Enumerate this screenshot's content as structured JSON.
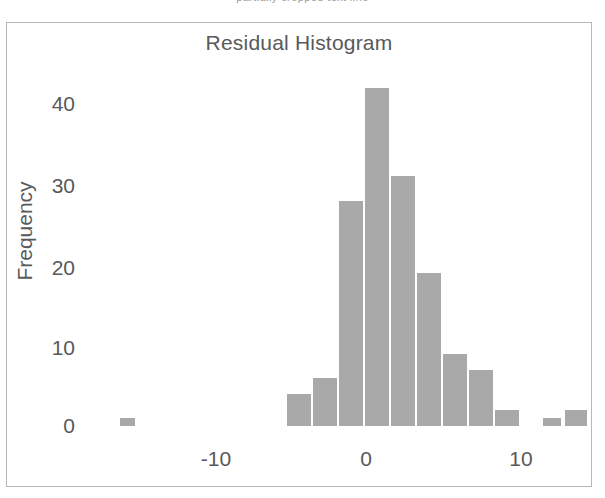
{
  "top_clip_text": "partially cropped text line",
  "figure": {
    "title": "Residual Histogram",
    "frame_color": "#b7b7b7",
    "background": "#ffffff"
  },
  "axes": {
    "y_label": "Frequency",
    "y_ticks": [
      "0",
      "10",
      "20",
      "30",
      "40"
    ],
    "x_ticks": [
      "-10",
      "0",
      "10"
    ]
  },
  "chart_data": {
    "type": "bar",
    "title": "Residual Histogram",
    "xlabel": "",
    "ylabel": "Frequency",
    "xlim": [
      -17,
      14
    ],
    "ylim": [
      0,
      45
    ],
    "grid": false,
    "legend": false,
    "bar_color": "#a9a9a9",
    "bin_width": 1.5,
    "x_tick_values": [
      -10,
      0,
      10
    ],
    "y_tick_values": [
      0,
      10,
      20,
      30,
      40
    ],
    "bin_centers": [
      -15.6,
      -5.2,
      -3.7,
      -2.2,
      -0.7,
      0.8,
      2.3,
      3.8,
      5.3,
      6.8,
      10.6,
      12.1
    ],
    "values": [
      1,
      4,
      6,
      28,
      42,
      31,
      19,
      9,
      7,
      2,
      1,
      2
    ],
    "bars": [
      {
        "center": -15.6,
        "value": 1,
        "px_left": 113,
        "px_width": 15
      },
      {
        "center": -5.2,
        "value": 4,
        "px_left": 280,
        "px_width": 24
      },
      {
        "center": -3.7,
        "value": 6,
        "px_left": 306,
        "px_width": 24
      },
      {
        "center": -2.2,
        "value": 28,
        "px_left": 332,
        "px_width": 24
      },
      {
        "center": -0.7,
        "value": 42,
        "px_left": 358,
        "px_width": 24
      },
      {
        "center": 0.8,
        "value": 31,
        "px_left": 384,
        "px_width": 24
      },
      {
        "center": 2.3,
        "value": 19,
        "px_left": 410,
        "px_width": 24
      },
      {
        "center": 3.8,
        "value": 9,
        "px_left": 436,
        "px_width": 24
      },
      {
        "center": 5.3,
        "value": 7,
        "px_left": 462,
        "px_width": 24
      },
      {
        "center": 6.8,
        "value": 2,
        "px_left": 488,
        "px_width": 24
      },
      {
        "center": 10.6,
        "value": 1,
        "px_left": 536,
        "px_width": 18
      },
      {
        "center": 12.1,
        "value": 2,
        "px_left": 558,
        "px_width": 22
      }
    ]
  },
  "layout": {
    "y_tick_px": [
      403,
      325,
      245,
      163,
      81
    ],
    "x_tick_px": [
      209,
      359,
      514
    ],
    "px_per_unit_y": 8.05
  }
}
